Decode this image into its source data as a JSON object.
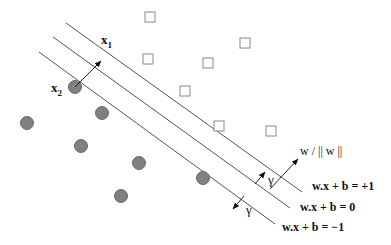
{
  "diagram": {
    "colors": {
      "line": "#555555",
      "circle_fill": "#808080",
      "circle_stroke": "#6a6a6a",
      "square_stroke": "#888888",
      "text": "#111111"
    },
    "hyperplanes": [
      {
        "id": "positive-margin",
        "label": "w.x + b = +1",
        "x1": 66,
        "y1": 23,
        "x2": 302,
        "y2": 192,
        "label_x": 312,
        "label_y": 190
      },
      {
        "id": "decision-boundary",
        "label": "w.x + b = 0",
        "x1": 53,
        "y1": 37,
        "x2": 290,
        "y2": 208,
        "label_x": 300,
        "label_y": 211
      },
      {
        "id": "negative-margin",
        "label": "w.x  + b = −1",
        "x1": 39,
        "y1": 52,
        "x2": 275,
        "y2": 224,
        "label_x": 282,
        "label_y": 231
      }
    ],
    "squares": [
      {
        "x": 150,
        "y": 17
      },
      {
        "x": 148,
        "y": 59
      },
      {
        "x": 245,
        "y": 43
      },
      {
        "x": 208,
        "y": 63
      },
      {
        "x": 185,
        "y": 91
      },
      {
        "x": 219,
        "y": 126
      },
      {
        "x": 271,
        "y": 131
      }
    ],
    "circles": [
      {
        "x": 75,
        "y": 87
      },
      {
        "x": 102,
        "y": 113
      },
      {
        "x": 27,
        "y": 123
      },
      {
        "x": 81,
        "y": 146
      },
      {
        "x": 139,
        "y": 163
      },
      {
        "x": 121,
        "y": 196
      },
      {
        "x": 203,
        "y": 178
      }
    ],
    "labels": {
      "x1": "x",
      "x1_sub": "1",
      "x2": "x",
      "x2_sub": "2",
      "normal": "w / || w ||",
      "gamma": "γ"
    }
  }
}
